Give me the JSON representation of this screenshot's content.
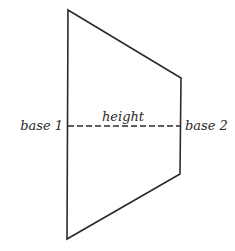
{
  "diagram": {
    "shape": "trapezoid",
    "stroke_color": "#2a2a2a",
    "background_color": "#ffffff",
    "vertices": {
      "top_left": [
        68,
        10
      ],
      "top_right": [
        181,
        78
      ],
      "bottom_right": [
        180,
        174
      ],
      "bottom_left": [
        67,
        239
      ]
    },
    "height_line": {
      "style": "dashed",
      "y": 126,
      "x1": 68,
      "x2": 180
    },
    "labels": {
      "base1": "base 1",
      "base2": "base 2",
      "height": "height"
    }
  }
}
